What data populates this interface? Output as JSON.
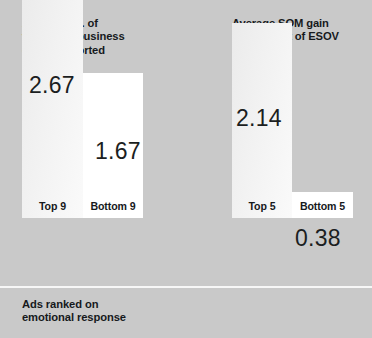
{
  "chart_data": {
    "type": "bar",
    "title": "",
    "background_color": "#c9c9c9",
    "grid": false,
    "legend": "none",
    "panels": [
      {
        "id": "left",
        "title": "Average no. of\nvery large business\neffects reported",
        "footnote": "Ads ranked on\nemotional response",
        "ylabel": "",
        "xlabel": "",
        "categories": [
          "Top 9",
          "Bottom 9"
        ],
        "values": [
          2.67,
          1.67
        ],
        "value_labels": [
          "2.67",
          "1.67"
        ],
        "bar_colors": [
          "#f2f2f2",
          "#ffffff"
        ],
        "ylim": [
          0,
          3.1
        ]
      },
      {
        "id": "right",
        "title": "Average SOM gain\nper % point of ESOV",
        "footnote": "Ads ranked on\nemotional response",
        "ylabel": "",
        "xlabel": "",
        "categories": [
          "Top 5",
          "Bottom 5"
        ],
        "values": [
          2.14,
          0.38
        ],
        "value_labels": [
          "2.14",
          "0.38"
        ],
        "bar_colors": [
          "#f2f2f2",
          "#ffffff"
        ],
        "ylim": [
          0,
          3.1
        ]
      }
    ]
  },
  "left_panel": {
    "title": "Average no. of\nvery large business\neffects reported",
    "footnote": "Ads ranked on\nemotional response",
    "bar1": {
      "value_label": "2.67",
      "category": "Top 9"
    },
    "bar2": {
      "value_label": "1.67",
      "category": "Bottom 9"
    }
  },
  "right_panel": {
    "title": "Average SOM gain\nper % point of ESOV",
    "footnote": "Ads ranked on\nemotional response",
    "bar1": {
      "value_label": "2.14",
      "category": "Top 5"
    },
    "bar2": {
      "value_label": "0.38",
      "category": "Bottom 5"
    }
  }
}
